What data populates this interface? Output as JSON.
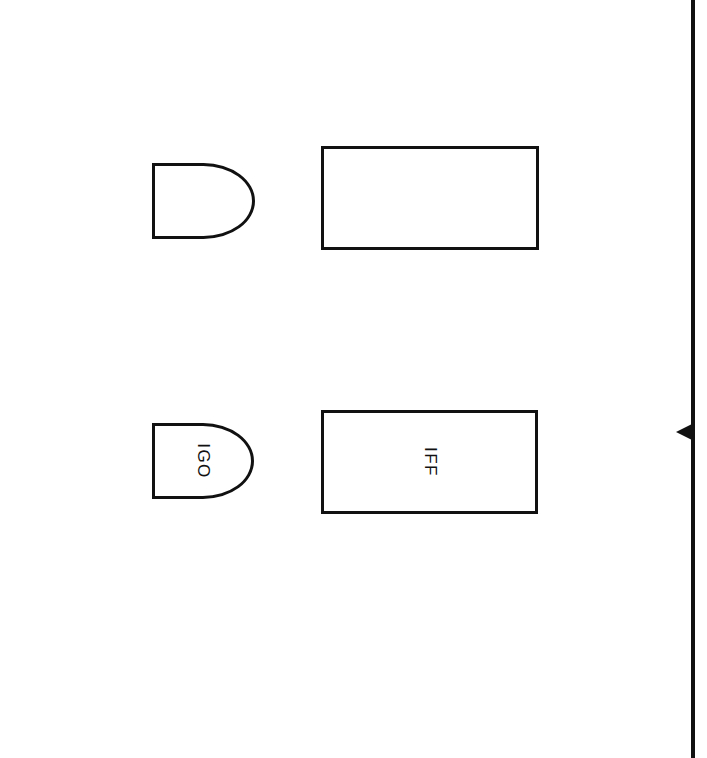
{
  "page": {
    "background_color": "#ffffff",
    "stroke_color": "#111111",
    "width": 707,
    "height": 758
  },
  "diagram": {
    "type": "block-diagram",
    "shapes": [
      {
        "id": "top-d-shape",
        "form": "d-shape",
        "label": "",
        "x": 152,
        "y": 163,
        "width": 103,
        "height": 76
      },
      {
        "id": "top-rectangle",
        "form": "rectangle",
        "label": "",
        "x": 321,
        "y": 146,
        "width": 218,
        "height": 104
      },
      {
        "id": "bottom-d-shape",
        "form": "d-shape",
        "label": "IGO",
        "x": 152,
        "y": 423,
        "width": 102,
        "height": 76
      },
      {
        "id": "bottom-rectangle",
        "form": "rectangle",
        "label": "IFF",
        "x": 321,
        "y": 410,
        "width": 217,
        "height": 104
      }
    ],
    "edge_marker": {
      "id": "right-edge-rule",
      "name": "vertical-rule",
      "x": 691,
      "arrow_direction": "left",
      "arrow_y": 432,
      "arrow_x": 676
    }
  }
}
